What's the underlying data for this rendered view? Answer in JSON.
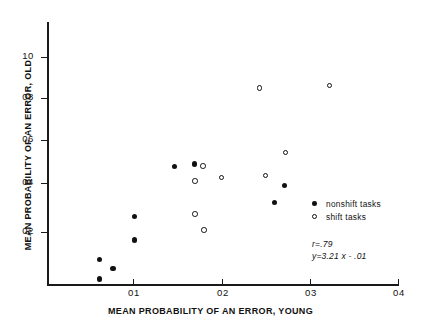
{
  "chart_data": {
    "type": "scatter",
    "title": "",
    "xlabel": "MEAN PROBABILITY OF AN ERROR, YOUNG",
    "ylabel": "MEAN PROBABILITY OF AN ERROR, OLD",
    "xlim": [
      0,
      0.04
    ],
    "ylim": [
      0,
      0.11
    ],
    "grid": false,
    "xticks": [
      {
        "value": 0.01,
        "label": "01"
      },
      {
        "value": 0.02,
        "label": "02"
      },
      {
        "value": 0.03,
        "label": "03"
      },
      {
        "value": 0.04,
        "label": "04"
      }
    ],
    "yticks": [
      {
        "value": 0.02,
        "label": "02"
      },
      {
        "value": 0.04,
        "label": "04"
      },
      {
        "value": 0.06,
        "label": "06"
      },
      {
        "value": 0.08,
        "label": "08"
      },
      {
        "value": 0.1,
        "label": "10"
      }
    ],
    "legend_position": "right-inside",
    "series": [
      {
        "name": "nonshift tasks",
        "marker": "filled-circle",
        "color": "#111111",
        "points": [
          {
            "x": 0.006,
            "y": 0.011
          },
          {
            "x": 0.006,
            "y": 0.0025
          },
          {
            "x": 0.0075,
            "y": 0.007
          },
          {
            "x": 0.01,
            "y": 0.03
          },
          {
            "x": 0.01,
            "y": 0.0195
          },
          {
            "x": 0.0145,
            "y": 0.052
          },
          {
            "x": 0.0168,
            "y": 0.053
          },
          {
            "x": 0.0259,
            "y": 0.036
          },
          {
            "x": 0.0271,
            "y": 0.0435
          }
        ]
      },
      {
        "name": "shift tasks",
        "marker": "open-circle",
        "color": "#111111",
        "points": [
          {
            "x": 0.0178,
            "y": 0.052
          },
          {
            "x": 0.0169,
            "y": 0.0455
          },
          {
            "x": 0.0169,
            "y": 0.031
          },
          {
            "x": 0.0179,
            "y": 0.024
          },
          {
            "x": 0.0199,
            "y": 0.047
          },
          {
            "x": 0.0242,
            "y": 0.0865
          },
          {
            "x": 0.0249,
            "y": 0.048
          },
          {
            "x": 0.0272,
            "y": 0.058
          },
          {
            "x": 0.0322,
            "y": 0.0875
          }
        ]
      }
    ],
    "annotations": [
      {
        "text": "r=.79"
      },
      {
        "text": "y=3.21 x - .01"
      }
    ]
  }
}
